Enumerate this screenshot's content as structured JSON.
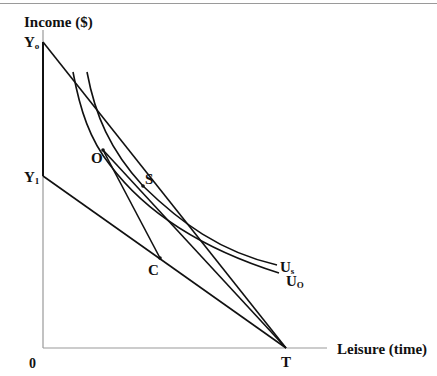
{
  "diagram": {
    "type": "labor-leisure indifference diagram",
    "axes": {
      "y_label": "Income ($)",
      "x_label": "Leisure (time)",
      "origin_label": "0"
    },
    "points": {
      "Yo": {
        "label": "Y",
        "sub": "o"
      },
      "Y1": {
        "label": "Y",
        "sub": "1"
      },
      "O": {
        "label": "O"
      },
      "S": {
        "label": "S"
      },
      "C": {
        "label": "C"
      },
      "T": {
        "label": "T"
      }
    },
    "curves": {
      "Us": {
        "label": "U",
        "sub": "s"
      },
      "Uo": {
        "label": "U",
        "sub": "O"
      }
    },
    "lines": [
      {
        "name": "budget-line-Yo-T",
        "from": "Yo",
        "to": "T"
      },
      {
        "name": "budget-line-Y1-T",
        "from": "Y1",
        "to": "T"
      },
      {
        "name": "segment-O-C",
        "from": "O",
        "to": "C"
      },
      {
        "name": "tangent-S-T",
        "from": "S",
        "to": "T"
      },
      {
        "name": "axis-segment-Yo-Y1",
        "from": "Yo",
        "to": "Y1"
      }
    ],
    "colors": {
      "ink": "#111111",
      "axis": "#999999"
    }
  }
}
